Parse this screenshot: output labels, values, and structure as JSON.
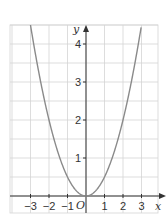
{
  "chart_data": {
    "type": "line",
    "title": "",
    "function": "y = x^2 / 2",
    "xlabel": "x",
    "ylabel": "y",
    "origin_label": "O",
    "xlim": [
      -4.1,
      4
    ],
    "ylim": [
      -0.5,
      4.5
    ],
    "grid": true,
    "x_ticks": [
      -3,
      -2,
      -1,
      1,
      2,
      3
    ],
    "x_tick_labels": [
      "−3",
      "−2",
      "−1",
      "1",
      "2",
      "3"
    ],
    "y_ticks": [
      1,
      2,
      3,
      4
    ],
    "y_tick_labels": [
      "1",
      "2",
      "3",
      "4"
    ],
    "series": [
      {
        "name": "parabola",
        "x": [
          -3,
          -2.5,
          -2,
          -1.5,
          -1,
          -0.5,
          0,
          0.5,
          1,
          1.5,
          2,
          2.5,
          3
        ],
        "y": [
          4.5,
          3.125,
          2,
          1.125,
          0.5,
          0.125,
          0,
          0.125,
          0.5,
          1.125,
          2,
          3.125,
          4.5
        ]
      }
    ],
    "colors": {
      "curve": "#8a8a8a",
      "axis": "#333333",
      "grid": "#d4d4d4"
    }
  }
}
